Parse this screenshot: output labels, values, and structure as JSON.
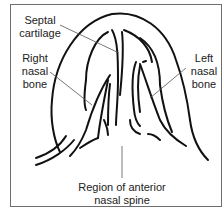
{
  "diagram": {
    "type": "anatomical-line-drawing",
    "labels": {
      "septal_cartilage": [
        "Septal",
        "cartilage"
      ],
      "right_nasal_bone": [
        "Right",
        "nasal",
        "bone"
      ],
      "left_nasal_bone": [
        "Left",
        "nasal",
        "bone"
      ],
      "anterior_nasal_spine": [
        "Region of anterior",
        "nasal spine"
      ]
    },
    "colors": {
      "line": "#111111",
      "leader": "#555555",
      "border": "#6e6e6e",
      "text": "#222222"
    }
  }
}
